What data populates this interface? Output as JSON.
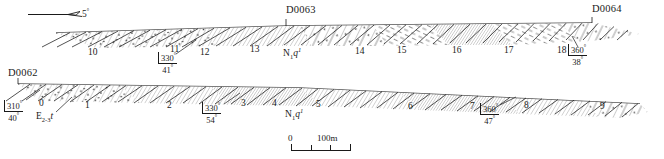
{
  "figure": {
    "type": "geological-cross-section",
    "width": 664,
    "height": 159,
    "ink_color": "#1a1a1a",
    "background": "#ffffff"
  },
  "slope_indicator": {
    "label": "5",
    "degree_symbol": "°",
    "icon": "slope-arrow-icon"
  },
  "panels": {
    "upper": {
      "stations": [
        {
          "name": "D0063",
          "x": 286,
          "y": 10
        },
        {
          "name": "D0064",
          "x": 592,
          "y": 10
        }
      ],
      "formation_labels": [
        {
          "main": "N",
          "sub": "1",
          "italic": "q",
          "sup": "1",
          "x": 283,
          "y": 52
        }
      ],
      "bed_numbers": [
        {
          "label": "10",
          "x": 88,
          "y": 53
        },
        {
          "label": "11",
          "x": 170,
          "y": 50
        },
        {
          "label": "12",
          "x": 200,
          "y": 53
        },
        {
          "label": "13",
          "x": 250,
          "y": 50
        },
        {
          "label": "14",
          "x": 355,
          "y": 52
        },
        {
          "label": "15",
          "x": 397,
          "y": 51
        },
        {
          "label": "16",
          "x": 452,
          "y": 51
        },
        {
          "label": "17",
          "x": 504,
          "y": 51
        },
        {
          "label": "18",
          "x": 557,
          "y": 51
        }
      ],
      "measurements": [
        {
          "azimuth": "330",
          "dip": "41",
          "x": 158,
          "y": 56
        },
        {
          "azimuth": "360",
          "dip": "38",
          "x": 568,
          "y": 48
        }
      ]
    },
    "lower": {
      "stations": [
        {
          "name": "D0062",
          "x": 8,
          "y": 72
        }
      ],
      "formation_labels": [
        {
          "main": "E",
          "sub": "2-3",
          "italic": "t",
          "sup": "",
          "x": 36,
          "y": 117
        },
        {
          "main": "N",
          "sub": "1",
          "italic": "q",
          "sup": "1",
          "x": 285,
          "y": 113
        }
      ],
      "bed_numbers": [
        {
          "label": "0",
          "x": 39,
          "y": 104
        },
        {
          "label": "1",
          "x": 85,
          "y": 106
        },
        {
          "label": "2",
          "x": 167,
          "y": 106
        },
        {
          "label": "3",
          "x": 241,
          "y": 104
        },
        {
          "label": "4",
          "x": 272,
          "y": 104
        },
        {
          "label": "5",
          "x": 316,
          "y": 105
        },
        {
          "label": "6",
          "x": 408,
          "y": 107
        },
        {
          "label": "7",
          "x": 470,
          "y": 107
        },
        {
          "label": "8",
          "x": 524,
          "y": 106
        },
        {
          "label": "9",
          "x": 600,
          "y": 107
        }
      ],
      "measurements": [
        {
          "azimuth": "310",
          "dip": "40",
          "x": 4,
          "y": 104
        },
        {
          "azimuth": "330",
          "dip": "54",
          "x": 202,
          "y": 106
        },
        {
          "azimuth": "360",
          "dip": "47",
          "x": 480,
          "y": 107
        }
      ]
    }
  },
  "scale": {
    "start_label": "0",
    "end_label": "100m",
    "x": 291,
    "y": 135
  }
}
